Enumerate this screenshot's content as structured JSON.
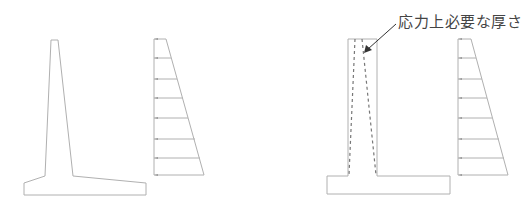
{
  "figures": {
    "left": {
      "caption": "",
      "wall": "inverted-T retaining wall with tapered stem",
      "pressure_diagram": {
        "arrow_count": 8
      }
    },
    "right": {
      "annotation": "応力上必要な厚さ",
      "wall": "rectangular stem with dashed required-thickness lines",
      "pressure_diagram": {
        "arrow_count": 8
      }
    }
  },
  "colors": {
    "line": "#b0b0b0",
    "dashed": "#777777",
    "arrow": "#333333",
    "text": "#444444"
  }
}
